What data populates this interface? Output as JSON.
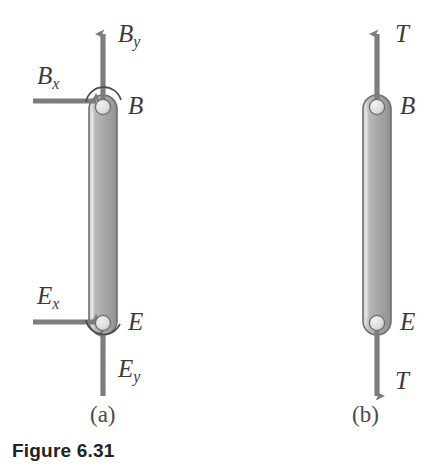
{
  "figure": {
    "caption": "Figure 6.31",
    "background_color": "#ffffff",
    "ink_color": "#7d7d7d",
    "text_color": "#3b3b3b",
    "link_fill_light": "#d6d6d6",
    "link_fill_dark": "#8f8f8f",
    "link_outline": "#6e6e6e",
    "pin_fill": "#e6e6e6"
  },
  "panels": [
    {
      "id": "a",
      "sublabel": "(a)",
      "description": "free-body diagram of member BE with pin reaction components",
      "joints": [
        {
          "name": "B",
          "label": "B",
          "position": "top"
        },
        {
          "name": "E",
          "label": "E",
          "position": "bottom"
        }
      ],
      "forces": [
        {
          "name": "By",
          "base": "B",
          "subscript": "y",
          "direction": "up",
          "at_joint": "B"
        },
        {
          "name": "Bx",
          "base": "B",
          "subscript": "x",
          "direction": "right",
          "at_joint": "B"
        },
        {
          "name": "Ex",
          "base": "E",
          "subscript": "x",
          "direction": "right",
          "at_joint": "E"
        },
        {
          "name": "Ey",
          "base": "E",
          "subscript": "y",
          "direction": "up",
          "at_joint": "E"
        }
      ]
    },
    {
      "id": "b",
      "sublabel": "(b)",
      "description": "two-force member BE carrying axial tension T",
      "joints": [
        {
          "name": "B",
          "label": "B",
          "position": "top"
        },
        {
          "name": "E",
          "label": "E",
          "position": "bottom"
        }
      ],
      "forces": [
        {
          "name": "T_top",
          "base": "T",
          "subscript": "",
          "direction": "up",
          "at_joint": "B"
        },
        {
          "name": "T_bottom",
          "base": "T",
          "subscript": "",
          "direction": "down",
          "at_joint": "E"
        }
      ]
    }
  ],
  "labels": {
    "panel_a": {
      "By_base": "B",
      "By_sub": "y",
      "Bx_base": "B",
      "Bx_sub": "x",
      "B_joint": "B",
      "Ex_base": "E",
      "Ex_sub": "x",
      "Ey_base": "E",
      "Ey_sub": "y",
      "E_joint": "E",
      "sublabel": "(a)"
    },
    "panel_b": {
      "T_top": "T",
      "B_joint": "B",
      "E_joint": "E",
      "T_bottom": "T",
      "sublabel": "(b)"
    }
  }
}
